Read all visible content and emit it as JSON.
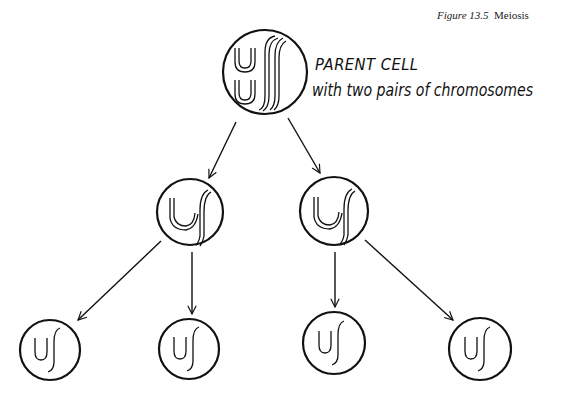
{
  "figure": {
    "caption_number": "Figure 13.5",
    "caption_title": "Meiosis"
  },
  "parent_cell": {
    "label": "PARENT CELL",
    "description": "with two pairs of chromosomes",
    "chromosome_pairs": 2
  },
  "diagram": {
    "stroke_color": "#111111",
    "background": "#ffffff",
    "nodes": [
      {
        "id": "parent",
        "cx": 265,
        "cy": 72,
        "r": 42,
        "level": 0,
        "content": "two pairs of double chromosomes (U-shaped and S-shaped)"
      },
      {
        "id": "daughter-1",
        "cx": 190,
        "cy": 212,
        "r": 33,
        "level": 1,
        "content": "one U-shaped + one S-shaped double chromosome"
      },
      {
        "id": "daughter-2",
        "cx": 334,
        "cy": 211,
        "r": 34,
        "level": 1,
        "content": "one U-shaped + one S-shaped double chromosome"
      },
      {
        "id": "gamete-1",
        "cx": 50,
        "cy": 350,
        "r": 30,
        "level": 2,
        "content": "single U + single S chromosome"
      },
      {
        "id": "gamete-2",
        "cx": 189,
        "cy": 349,
        "r": 30,
        "level": 2,
        "content": "single U + single S chromosome"
      },
      {
        "id": "gamete-3",
        "cx": 334,
        "cy": 343,
        "r": 31,
        "level": 2,
        "content": "single U + single S chromosome"
      },
      {
        "id": "gamete-4",
        "cx": 480,
        "cy": 349,
        "r": 31,
        "level": 2,
        "content": "single U + single S chromosome"
      }
    ],
    "edges": [
      {
        "from": "parent",
        "to": "daughter-1",
        "x1": 236,
        "y1": 122,
        "x2": 209,
        "y2": 178
      },
      {
        "from": "parent",
        "to": "daughter-2",
        "x1": 288,
        "y1": 118,
        "x2": 320,
        "y2": 173
      },
      {
        "from": "daughter-1",
        "to": "gamete-1",
        "x1": 161,
        "y1": 241,
        "x2": 78,
        "y2": 320
      },
      {
        "from": "daughter-1",
        "to": "gamete-2",
        "x1": 192,
        "y1": 252,
        "x2": 192,
        "y2": 314
      },
      {
        "from": "daughter-2",
        "to": "gamete-3",
        "x1": 335,
        "y1": 252,
        "x2": 335,
        "y2": 307
      },
      {
        "from": "daughter-2",
        "to": "gamete-4",
        "x1": 365,
        "y1": 240,
        "x2": 453,
        "y2": 320
      }
    ]
  }
}
